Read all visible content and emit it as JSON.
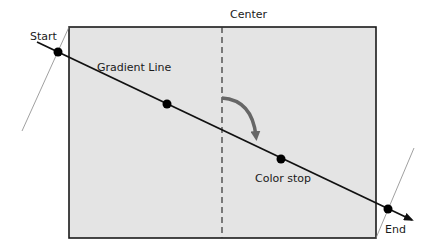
{
  "diagram": {
    "labels": {
      "center": "Center",
      "start": "Start",
      "gradient_line": "Gradient Line",
      "color_stop": "Color stop",
      "end": "End"
    },
    "colors": {
      "box_fill": "#e4e4e4",
      "box_stroke": "#1a1a1a",
      "line": "#111111",
      "arrow_curve": "#666666",
      "perpendicular": "#888888"
    },
    "points": [
      "start",
      "intermediate-stop",
      "color-stop",
      "end"
    ]
  }
}
